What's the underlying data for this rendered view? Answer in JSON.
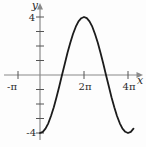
{
  "figure": {
    "labels": {
      "y_axis": "y",
      "x_axis": "x",
      "y_max": "4",
      "y_min": "-4",
      "x_neg_pi": "-π",
      "x_two_pi": "2π",
      "x_four_pi": "4π"
    },
    "colors": {
      "axis": "#8a8a8a",
      "curve": "#1c1c1c",
      "text": "#2b2b2b",
      "background": "#fdfdfd"
    }
  },
  "chart_data": {
    "type": "line",
    "title": "",
    "xlabel": "x",
    "ylabel": "y",
    "x_unit": "π",
    "function": "y = -4 cos(x/2)",
    "xlim_over_pi": [
      -1.6,
      4.7
    ],
    "ylim": [
      -4.6,
      4.6
    ],
    "x_ticks_over_pi": [
      -1,
      2,
      4
    ],
    "x_tick_labels": [
      "-π",
      "2π",
      "4π"
    ],
    "y_ticks": [
      -4,
      -3,
      -2,
      -1,
      1,
      2,
      3,
      4
    ],
    "y_tick_labels_shown": [
      "4",
      "-4"
    ],
    "grid": false,
    "legend": false,
    "series": [
      {
        "name": "y = -4 cos(x/2)",
        "x_over_pi": [
          0,
          0.125,
          0.25,
          0.375,
          0.5,
          0.625,
          0.75,
          0.875,
          1,
          1.125,
          1.25,
          1.375,
          1.5,
          1.625,
          1.75,
          1.875,
          2,
          2.125,
          2.25,
          2.375,
          2.5,
          2.625,
          2.75,
          2.875,
          3,
          3.125,
          3.25,
          3.375,
          3.5,
          3.625,
          3.75,
          3.875,
          4,
          4.125,
          4.25
        ],
        "y": [
          -4,
          -3.92,
          -3.7,
          -3.33,
          -2.83,
          -2.22,
          -1.53,
          -0.78,
          0,
          0.78,
          1.53,
          2.22,
          2.83,
          3.33,
          3.7,
          3.92,
          4,
          3.92,
          3.7,
          3.33,
          2.83,
          2.22,
          1.53,
          0.78,
          0,
          -0.78,
          -1.53,
          -2.22,
          -2.83,
          -3.33,
          -3.7,
          -3.92,
          -4,
          -3.92,
          -3.7
        ]
      }
    ]
  }
}
